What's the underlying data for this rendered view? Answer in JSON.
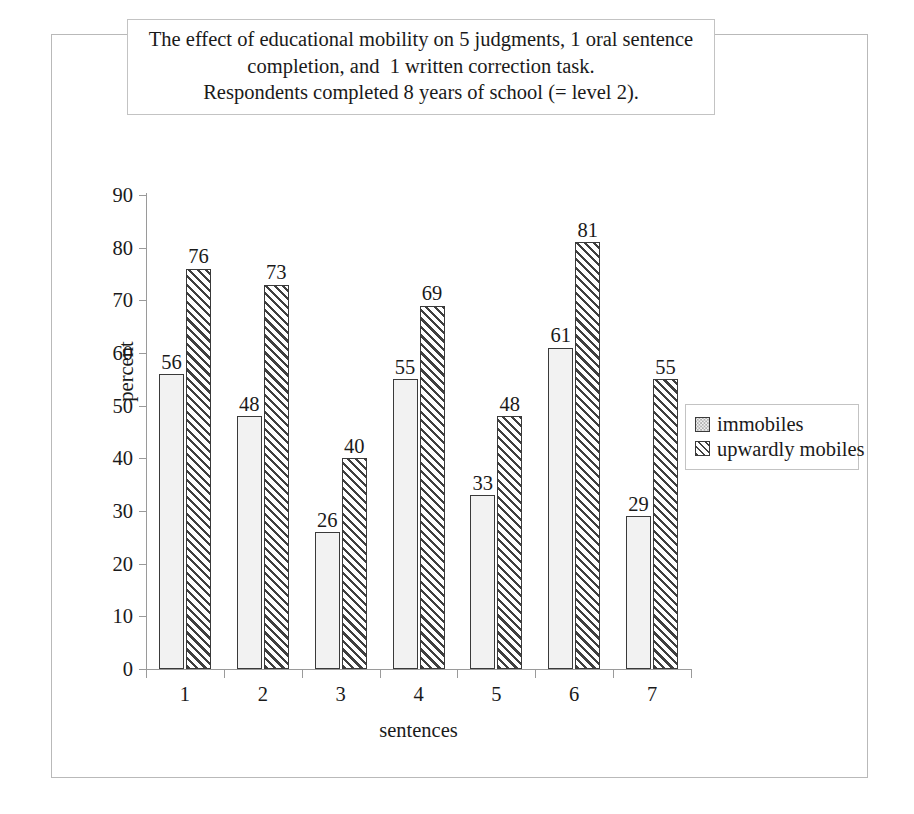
{
  "title": {
    "line1": "The effect of educational mobility on 5 judgments, 1 oral sentence",
    "line2": "completion, and  1 written correction task.",
    "line3": "Respondents completed 8 years of school (= level 2)."
  },
  "chart_data": {
    "type": "bar",
    "title": "The effect of educational mobility on 5 judgments, 1 oral sentence completion, and  1 written correction task. Respondents completed 8 years of school (= level 2).",
    "xlabel": "sentences",
    "ylabel": "percent",
    "categories": [
      "1",
      "2",
      "3",
      "4",
      "5",
      "6",
      "7"
    ],
    "series": [
      {
        "name": "immobiles",
        "values": [
          56,
          48,
          26,
          55,
          33,
          61,
          29
        ]
      },
      {
        "name": "upwardly mobiles",
        "values": [
          76,
          73,
          40,
          69,
          48,
          81,
          55
        ]
      }
    ],
    "ylim": [
      0,
      90
    ],
    "yticks": [
      0,
      10,
      20,
      30,
      40,
      50,
      60,
      70,
      80,
      90
    ],
    "ytick_labels": [
      "0",
      "10",
      "20",
      "30",
      "40",
      "50",
      "60",
      "70",
      "80",
      "90"
    ],
    "grid": false,
    "data_labels": true,
    "legend_position": "right",
    "colors": {
      "series1_fill": "#f2f2f2",
      "series1_pattern": "dotted",
      "series2_fill": "#ffffff",
      "series2_pattern": "diagonal-hatch",
      "bar_outline": "#3a3a3a",
      "axis": "#9a9a9a",
      "frame": "#b9b9b9",
      "text": "#1a1a1a"
    }
  },
  "legend": {
    "items": [
      {
        "label": "immobiles"
      },
      {
        "label": "upwardly mobiles"
      }
    ]
  }
}
